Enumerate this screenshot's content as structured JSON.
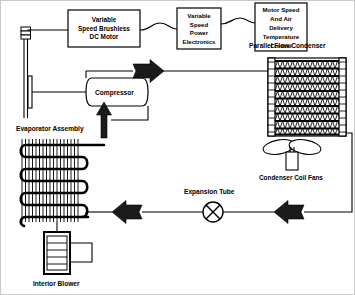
{
  "diagram": {
    "background_color": "#ffffff",
    "line_color": "#000000",
    "arrow_color": "#1a1a1a",
    "border_color": "#c9c9c9",
    "width": 355,
    "height": 295
  },
  "control_boxes": [
    {
      "id": "motor-box",
      "lines": [
        "Variable",
        "Speed Brushless",
        "DC Motor"
      ],
      "x": 68,
      "y": 10,
      "width": 72,
      "height": 37
    },
    {
      "id": "power-electronics-box",
      "lines": [
        "Variable",
        "Speed",
        "Power",
        "Electronics"
      ],
      "x": 177,
      "y": 8,
      "width": 44,
      "height": 41
    },
    {
      "id": "control-box",
      "lines": [
        "Motor Speed",
        "And Air",
        "Delivery",
        "Temperature",
        "Control"
      ],
      "x": 255,
      "y": 3,
      "width": 52,
      "height": 48
    }
  ],
  "components": {
    "compressor": {
      "label": "Compressor",
      "x": 86,
      "y": 78,
      "width": 62,
      "height": 28
    },
    "condenser": {
      "label": "Parallel Flow Condenser",
      "label_x": 289,
      "label_y": 47,
      "x": 268,
      "y": 58,
      "width": 78,
      "height": 78,
      "tube_rows": 10
    },
    "condenser_fans": {
      "label": "Condenser Coil Fans",
      "label_x": 292,
      "label_y": 178,
      "center_x": 292,
      "center_y": 148,
      "blade_count": 2
    },
    "evaporator": {
      "label": "Evaporator Assembly",
      "label_x": 52,
      "label_y": 130,
      "x": 18,
      "y": 137,
      "width": 68,
      "height": 84,
      "serpentine_rows": 6,
      "fin_count": 12
    },
    "interior_blower": {
      "label": "Interior Blower",
      "label_x": 57,
      "label_y": 284,
      "x": 44,
      "y": 232,
      "width": 26,
      "height": 42
    },
    "expansion_tube": {
      "label": "Expansion Tube",
      "label_x": 215,
      "label_y": 192,
      "center_x": 213,
      "center_y": 212,
      "radius": 10
    },
    "drive_shaft": {
      "name": "motor-compressor-shaft",
      "x": 24,
      "y": 28,
      "height": 90
    }
  },
  "flow_arrows": [
    {
      "id": "discharge-arrow",
      "direction": "right",
      "x": 133,
      "y": 71,
      "description": "Compressor discharge to condenser"
    },
    {
      "id": "suction-arrow",
      "direction": "up",
      "x": 104,
      "y": 100,
      "description": "Evaporator suction return to compressor"
    },
    {
      "id": "evaporator-inlet-arrow",
      "direction": "left",
      "x": 128,
      "y": 212,
      "description": "Liquid line to evaporator"
    },
    {
      "id": "condenser-outlet-arrow",
      "direction": "left",
      "x": 290,
      "y": 212,
      "description": "Condenser liquid outlet to expansion tube"
    }
  ],
  "signal_links": [
    {
      "id": "motor-to-power-electronics",
      "from": "motor-box",
      "to": "power-electronics-box"
    },
    {
      "id": "power-electronics-to-control",
      "from": "power-electronics-box",
      "to": "control-box"
    }
  ]
}
